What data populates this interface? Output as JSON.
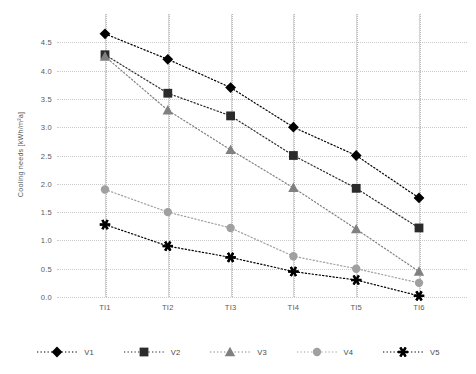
{
  "chart_data": {
    "type": "line",
    "title": "",
    "xlabel": "",
    "ylabel": "Cooling needs [kWh/m²a]",
    "categories": [
      "TI1",
      "TI2",
      "TI3",
      "TI4",
      "TI5",
      "TI6"
    ],
    "ylim": [
      0.0,
      5.0
    ],
    "ytick_labels": [
      "0.0",
      "0.5",
      "1.0",
      "1.5",
      "2.0",
      "2.5",
      "3.0",
      "3.5",
      "4.0",
      "4.5"
    ],
    "ytick_values": [
      0.0,
      0.5,
      1.0,
      1.5,
      2.0,
      2.5,
      3.0,
      3.5,
      4.0,
      4.5
    ],
    "grid": true,
    "legend_position": "bottom",
    "line_style": "dotted",
    "series": [
      {
        "name": "V1",
        "marker": "diamond",
        "color": "#000000",
        "values": [
          4.65,
          4.2,
          3.7,
          3.0,
          2.5,
          1.75
        ]
      },
      {
        "name": "V2",
        "marker": "square",
        "color": "#2b2b2b",
        "values": [
          4.28,
          3.6,
          3.2,
          2.5,
          1.92,
          1.22
        ]
      },
      {
        "name": "V3",
        "marker": "triangle",
        "color": "#808080",
        "values": [
          4.25,
          3.3,
          2.6,
          1.93,
          1.2,
          0.45
        ]
      },
      {
        "name": "V4",
        "marker": "circle",
        "color": "#a0a0a0",
        "values": [
          1.9,
          1.5,
          1.22,
          0.72,
          0.5,
          0.25
        ]
      },
      {
        "name": "V5",
        "marker": "asterisk",
        "color": "#000000",
        "values": [
          1.28,
          0.9,
          0.7,
          0.45,
          0.3,
          0.02
        ]
      }
    ]
  },
  "legend": {
    "items": [
      {
        "label": "V1"
      },
      {
        "label": "V2"
      },
      {
        "label": "V3"
      },
      {
        "label": "V4"
      },
      {
        "label": "V5"
      }
    ]
  },
  "colors": {
    "grid": "#c9c9c9",
    "axis_text": "#5a5a5a",
    "background": "#ffffff"
  }
}
